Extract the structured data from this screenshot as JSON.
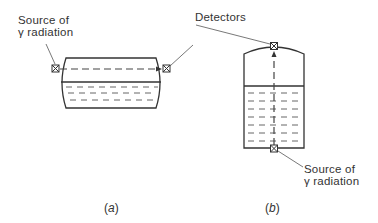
{
  "figure": {
    "panel_a": {
      "caption_open": "(",
      "caption_letter": "a",
      "caption_close": ")",
      "source_label_line1": "Source of",
      "source_label_line2": "γ radiation",
      "description": "Horizontal vessel with gamma source on left end and detector on right end; beam passes horizontally through vapour space above liquid"
    },
    "panel_b": {
      "caption_open": "(",
      "caption_letter": "b",
      "caption_close": ")",
      "source_label_line1": "Source of",
      "source_label_line2": "γ radiation",
      "description": "Vertical vessel with gamma source at bottom and detector at top; beam passes vertically through liquid"
    },
    "shared": {
      "detectors_label": "Detectors"
    },
    "colors": {
      "line": "#333333",
      "dash": "#555555",
      "background": "#ffffff"
    }
  }
}
